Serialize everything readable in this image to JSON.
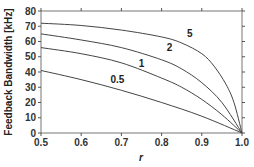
{
  "chart_data": {
    "type": "line",
    "title": "",
    "xlabel": "r",
    "ylabel": "Feedback Bandwidth [kHz]",
    "xlim": [
      0.5,
      1.0
    ],
    "ylim": [
      0,
      80
    ],
    "xticks": [
      "0.5",
      "0.6",
      "0.7",
      "0.8",
      "0.9",
      "1.0"
    ],
    "yticks": [
      "0",
      "10",
      "20",
      "30",
      "40",
      "50",
      "60",
      "70",
      "80"
    ],
    "grid": false,
    "legend": "inline curve labels",
    "series": [
      {
        "name": "5",
        "x": [
          0.5,
          0.6,
          0.7,
          0.8,
          0.85,
          0.9,
          0.93,
          0.96,
          0.98,
          1.0
        ],
        "values": [
          72,
          70.5,
          67.5,
          63,
          59,
          52,
          44,
          32,
          20,
          0
        ]
      },
      {
        "name": "2",
        "x": [
          0.5,
          0.6,
          0.7,
          0.8,
          0.85,
          0.9,
          0.95,
          1.0
        ],
        "values": [
          65,
          61,
          56,
          48,
          42,
          33,
          20,
          0
        ]
      },
      {
        "name": "1",
        "x": [
          0.5,
          0.6,
          0.7,
          0.8,
          0.85,
          0.9,
          0.95,
          1.0
        ],
        "values": [
          56,
          52,
          46,
          36,
          30,
          22,
          12,
          0
        ]
      },
      {
        "name": "0.5",
        "x": [
          0.5,
          0.6,
          0.7,
          0.8,
          0.9,
          1.0
        ],
        "values": [
          41,
          35,
          28,
          20,
          11,
          0
        ]
      }
    ],
    "annotations": [
      {
        "text": "5",
        "x": 0.87,
        "y": 63
      },
      {
        "text": "2",
        "x": 0.82,
        "y": 54
      },
      {
        "text": "1",
        "x": 0.75,
        "y": 43
      },
      {
        "text": "0.5",
        "x": 0.69,
        "y": 33
      }
    ]
  }
}
